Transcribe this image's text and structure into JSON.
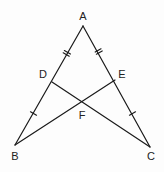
{
  "diagram": {
    "type": "geometry",
    "stroke_color": "#1a1a1a",
    "label_color": "#222222",
    "points": {
      "A": {
        "label": "A",
        "x": 83,
        "y": 26,
        "label_x": 83,
        "label_y": 20
      },
      "B": {
        "label": "B",
        "x": 15,
        "y": 145,
        "label_x": 15,
        "label_y": 160
      },
      "C": {
        "label": "C",
        "x": 150,
        "y": 147,
        "label_x": 151,
        "label_y": 160
      },
      "D": {
        "label": "D",
        "x": 52,
        "y": 82,
        "label_x": 43,
        "label_y": 78
      },
      "E": {
        "label": "E",
        "x": 115,
        "y": 80,
        "label_x": 122,
        "label_y": 78
      },
      "F": {
        "label": "F",
        "x": 82,
        "y": 102,
        "label_x": 82,
        "label_y": 119
      }
    },
    "segments": [
      {
        "from": "A",
        "to": "B"
      },
      {
        "from": "A",
        "to": "C"
      },
      {
        "from": "B",
        "to": "E"
      },
      {
        "from": "C",
        "to": "D"
      }
    ],
    "tick_marks": [
      {
        "segment": "AD",
        "count": 2
      },
      {
        "segment": "AE",
        "count": 2
      },
      {
        "segment": "DB",
        "count": 1
      },
      {
        "segment": "EC",
        "count": 1
      }
    ]
  }
}
